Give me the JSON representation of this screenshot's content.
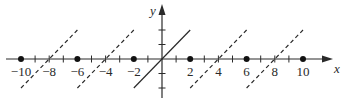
{
  "chart_data": {
    "type": "line",
    "title": "",
    "xlabel": "x",
    "ylabel": "y",
    "xlim": [
      -11,
      11.5
    ],
    "ylim": [
      -2.7,
      3.7
    ],
    "grid": false,
    "legend": null,
    "x_tick_labels": [
      "-10",
      "-8",
      "-6",
      "-4",
      "-2",
      "2",
      "4",
      "6",
      "8",
      "10"
    ],
    "x_tick_label_values": [
      -10,
      -8,
      -6,
      -4,
      -2,
      2,
      4,
      6,
      8,
      10
    ],
    "x_tick_marks": [
      -9,
      -8,
      -7,
      -5,
      -4,
      -3,
      -1,
      1,
      3,
      4,
      5,
      7,
      8,
      9
    ],
    "y_tick_marks": [
      -2,
      -1,
      1,
      2
    ],
    "series": [
      {
        "name": "y = x (base period)",
        "style": "solid",
        "points": [
          [
            -2,
            -2
          ],
          [
            2,
            2
          ]
        ]
      },
      {
        "name": "y = x + 8",
        "style": "dashed",
        "points": [
          [
            -10,
            -2
          ],
          [
            -6,
            2
          ]
        ]
      },
      {
        "name": "y = x + 4",
        "style": "dashed",
        "points": [
          [
            -6,
            -2
          ],
          [
            -2,
            2
          ]
        ]
      },
      {
        "name": "y = x - 4",
        "style": "dashed",
        "points": [
          [
            2,
            -2
          ],
          [
            6,
            2
          ]
        ]
      },
      {
        "name": "y = x - 8",
        "style": "dashed",
        "points": [
          [
            6,
            -2
          ],
          [
            10,
            2
          ]
        ]
      }
    ],
    "points": {
      "name": "filled dots at discontinuities",
      "values": [
        [
          -10,
          0
        ],
        [
          -6,
          0
        ],
        [
          -2,
          0
        ],
        [
          2,
          0
        ],
        [
          6,
          0
        ],
        [
          10,
          0
        ]
      ]
    },
    "annotations": [
      "Periodic extension of f(x)=x on (-2,2) with period 4"
    ]
  }
}
